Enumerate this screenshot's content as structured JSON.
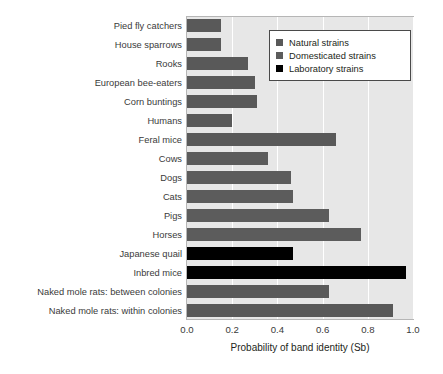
{
  "chart_data": {
    "type": "bar",
    "orientation": "horizontal",
    "title": "",
    "xlabel": "Probability of band identity (Sb)",
    "ylabel": "",
    "xlim": [
      0.0,
      1.0
    ],
    "xticks": [
      "0.0",
      "0.2",
      "0.4",
      "0.6",
      "0.8",
      "1.0"
    ],
    "xtick_values": [
      0.0,
      0.2,
      0.4,
      0.6,
      0.8,
      1.0
    ],
    "grid": "vertical",
    "legend_position": "top-right",
    "categories": [
      "Pied fly catchers",
      "House sparrows",
      "Rooks",
      "European bee-eaters",
      "Corn buntings",
      "Humans",
      "Feral mice",
      "Cows",
      "Dogs",
      "Cats",
      "Pigs",
      "Horses",
      "Japanese quail",
      "Inbred mice",
      "Naked mole rats: between colonies",
      "Naked mole rats: within colonies"
    ],
    "values": [
      0.15,
      0.15,
      0.27,
      0.3,
      0.31,
      0.2,
      0.66,
      0.36,
      0.46,
      0.47,
      0.63,
      0.77,
      0.47,
      0.97,
      0.63,
      0.91
    ],
    "groups": [
      "Natural strains",
      "Natural strains",
      "Natural strains",
      "Natural strains",
      "Natural strains",
      "Natural strains",
      "Natural strains",
      "Domesticated strains",
      "Domesticated strains",
      "Domesticated strains",
      "Domesticated strains",
      "Domesticated strains",
      "Laboratory strains",
      "Laboratory strains",
      "Natural strains",
      "Natural strains"
    ],
    "series": [
      {
        "name": "Natural strains",
        "color": "#595959",
        "points": [
          {
            "category": "Pied fly catchers",
            "value": 0.15
          },
          {
            "category": "House sparrows",
            "value": 0.15
          },
          {
            "category": "Rooks",
            "value": 0.27
          },
          {
            "category": "European bee-eaters",
            "value": 0.3
          },
          {
            "category": "Corn buntings",
            "value": 0.31
          },
          {
            "category": "Humans",
            "value": 0.2
          },
          {
            "category": "Feral mice",
            "value": 0.66
          },
          {
            "category": "Naked mole rats: between colonies",
            "value": 0.63
          },
          {
            "category": "Naked mole rats: within colonies",
            "value": 0.91
          }
        ]
      },
      {
        "name": "Domesticated strains",
        "color": "#5c5c5c",
        "points": [
          {
            "category": "Cows",
            "value": 0.36
          },
          {
            "category": "Dogs",
            "value": 0.46
          },
          {
            "category": "Cats",
            "value": 0.47
          },
          {
            "category": "Pigs",
            "value": 0.63
          },
          {
            "category": "Horses",
            "value": 0.77
          }
        ]
      },
      {
        "name": "Laboratory strains",
        "color": "#000000",
        "points": [
          {
            "category": "Japanese quail",
            "value": 0.47
          },
          {
            "category": "Inbred mice",
            "value": 0.97
          }
        ]
      }
    ]
  },
  "legend": {
    "items": [
      {
        "label": "Natural strains",
        "color": "#595959"
      },
      {
        "label": "Domesticated strains",
        "color": "#5c5c5c"
      },
      {
        "label": "Laboratory strains",
        "color": "#000000"
      }
    ]
  },
  "colors": {
    "plot_background": "#e7e7e7",
    "gridline": "#ffffff",
    "axis_text": "#3a3a3a",
    "natural": "#595959",
    "domesticated": "#5c5c5c",
    "laboratory": "#000000"
  }
}
